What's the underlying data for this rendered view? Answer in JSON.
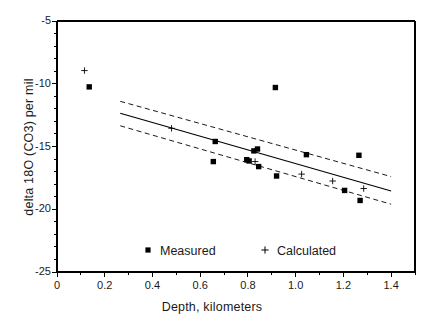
{
  "chart_data": {
    "type": "scatter",
    "title": "",
    "xlabel": "Depth,  kilometers",
    "ylabel": "delta 18O (CO3)  per mil",
    "xlim": [
      0,
      1.5
    ],
    "ylim": [
      -25,
      -5
    ],
    "grid": false,
    "legend_position": "inside-bottom-center",
    "xticks": [
      "0",
      "0.2",
      "0.4",
      "0.6",
      "0.8",
      "1.0",
      "1.2",
      "1.4"
    ],
    "xtick_values": [
      0,
      0.2,
      0.4,
      0.6,
      0.8,
      1.0,
      1.2,
      1.4
    ],
    "yticks": [
      "-5",
      "-10",
      "-15",
      "-20",
      "-25"
    ],
    "ytick_values": [
      -5,
      -10,
      -15,
      -20,
      -25
    ],
    "xminor_step": 0.1,
    "yminor_step": 1,
    "series": [
      {
        "name": "Measured",
        "marker": "square",
        "color": "#000000",
        "points": [
          {
            "x": 0.135,
            "y": -10.25
          },
          {
            "x": 0.663,
            "y": -14.6
          },
          {
            "x": 0.655,
            "y": -16.2
          },
          {
            "x": 0.795,
            "y": -16.05
          },
          {
            "x": 0.805,
            "y": -16.15
          },
          {
            "x": 0.825,
            "y": -15.35
          },
          {
            "x": 0.84,
            "y": -15.2
          },
          {
            "x": 0.845,
            "y": -16.6
          },
          {
            "x": 0.915,
            "y": -10.3
          },
          {
            "x": 0.92,
            "y": -17.35
          },
          {
            "x": 1.045,
            "y": -15.65
          },
          {
            "x": 1.205,
            "y": -18.5
          },
          {
            "x": 1.265,
            "y": -15.7
          },
          {
            "x": 1.27,
            "y": -19.3
          }
        ]
      },
      {
        "name": "Calculated",
        "marker": "plus",
        "color": "#000000",
        "points": [
          {
            "x": 0.115,
            "y": -8.95
          },
          {
            "x": 0.48,
            "y": -13.55
          },
          {
            "x": 0.83,
            "y": -16.2
          },
          {
            "x": 1.025,
            "y": -17.2
          },
          {
            "x": 1.155,
            "y": -17.75
          },
          {
            "x": 1.285,
            "y": -18.35
          }
        ]
      }
    ],
    "fit_line": {
      "name": "regression",
      "style": "solid",
      "x_start": 0.265,
      "y_start": -12.35,
      "x_end": 1.4,
      "y_end": -18.55
    },
    "confidence_bands": [
      {
        "name": "upper-band",
        "style": "dashed",
        "x_start": 0.265,
        "y_start": -11.4,
        "x_end": 1.4,
        "y_end": -17.4
      },
      {
        "name": "lower-band",
        "style": "dashed",
        "x_start": 0.265,
        "y_start": -13.35,
        "x_end": 1.4,
        "y_end": -19.6
      }
    ]
  },
  "legend": {
    "measured_label": "Measured",
    "calculated_label": "Calculated"
  },
  "axes": {
    "xlabel": "Depth,  kilometers",
    "ylabel": "delta 18O (CO3)  per mil"
  }
}
